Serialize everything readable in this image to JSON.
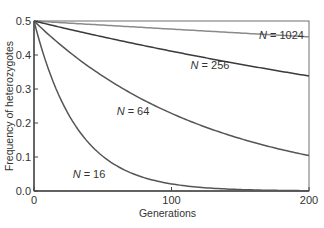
{
  "chart_data": {
    "type": "line",
    "title": "",
    "xlabel": "Generations",
    "ylabel": "Frequency of heterozygotes",
    "xlim": [
      0,
      200
    ],
    "ylim": [
      0.0,
      0.5
    ],
    "xticks": [
      0,
      100,
      200
    ],
    "xtick_labels": [
      "0",
      "100",
      "200"
    ],
    "yticks": [
      0.0,
      0.1,
      0.2,
      0.3,
      0.4,
      0.5
    ],
    "ytick_labels": [
      "0.0",
      "0.1",
      "0.2",
      "0.3",
      "0.4",
      "0.5"
    ],
    "grid": false,
    "legend": "inline labels",
    "x": [
      0,
      10,
      20,
      30,
      40,
      50,
      60,
      70,
      80,
      90,
      100,
      110,
      120,
      130,
      140,
      150,
      160,
      170,
      180,
      190,
      200
    ],
    "series": [
      {
        "name": "N = 1024",
        "label": "N = 1024",
        "color": "#8a8a8a",
        "values": [
          0.5,
          0.498,
          0.495,
          0.493,
          0.49,
          0.488,
          0.486,
          0.483,
          0.481,
          0.479,
          0.476,
          0.474,
          0.472,
          0.47,
          0.467,
          0.465,
          0.463,
          0.461,
          0.458,
          0.456,
          0.454
        ]
      },
      {
        "name": "N = 256",
        "label": "N = 256",
        "color": "#3a3a3a",
        "values": [
          0.5,
          0.49,
          0.481,
          0.472,
          0.463,
          0.454,
          0.445,
          0.436,
          0.428,
          0.42,
          0.411,
          0.403,
          0.396,
          0.388,
          0.381,
          0.373,
          0.366,
          0.359,
          0.352,
          0.346,
          0.339
        ]
      },
      {
        "name": "N = 64",
        "label": "N = 64",
        "color": "#555555",
        "values": [
          0.5,
          0.462,
          0.427,
          0.395,
          0.366,
          0.338,
          0.313,
          0.289,
          0.267,
          0.247,
          0.229,
          0.212,
          0.196,
          0.181,
          0.167,
          0.155,
          0.143,
          0.132,
          0.122,
          0.113,
          0.105
        ]
      },
      {
        "name": "N = 16",
        "label": "N = 16",
        "color": "#555555",
        "values": [
          0.5,
          0.362,
          0.262,
          0.19,
          0.138,
          0.1,
          0.072,
          0.052,
          0.038,
          0.027,
          0.02,
          0.014,
          0.01,
          0.008,
          0.005,
          0.004,
          0.003,
          0.002,
          0.002,
          0.001,
          0.001
        ]
      }
    ],
    "annotations": [
      {
        "text": "N = 1024",
        "x": 180,
        "y": 0.46
      },
      {
        "text": "N = 256",
        "x": 128,
        "y": 0.37
      },
      {
        "text": "N = 64",
        "x": 72,
        "y": 0.235
      },
      {
        "text": "N = 16",
        "x": 40,
        "y": 0.05
      }
    ]
  }
}
